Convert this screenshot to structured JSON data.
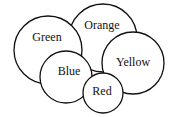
{
  "diagram": {
    "type": "overlapping-circles",
    "circles": [
      {
        "id": "orange",
        "label": "Orange",
        "cx": 103,
        "cy": 38,
        "r": 34,
        "label_x": 102,
        "label_y": 26
      },
      {
        "id": "green",
        "label": "Green",
        "cx": 48,
        "cy": 50,
        "r": 34,
        "label_x": 47,
        "label_y": 38
      },
      {
        "id": "yellow",
        "label": "Yellow",
        "cx": 133,
        "cy": 63,
        "r": 31,
        "label_x": 133,
        "label_y": 63
      },
      {
        "id": "blue",
        "label": "Blue",
        "cx": 66,
        "cy": 77,
        "r": 26,
        "label_x": 69,
        "label_y": 72
      },
      {
        "id": "red",
        "label": "Red",
        "cx": 103,
        "cy": 93,
        "r": 20,
        "label_x": 102,
        "label_y": 92
      }
    ]
  }
}
